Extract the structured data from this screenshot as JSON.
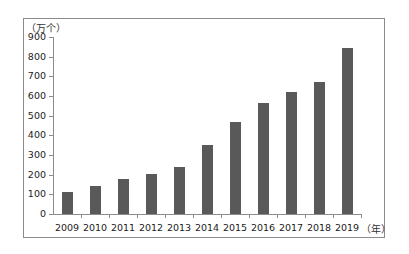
{
  "chart_data": {
    "type": "bar",
    "title": "",
    "xlabel": "（年）",
    "ylabel": "（万个）",
    "categories": [
      "2009",
      "2010",
      "2011",
      "2012",
      "2013",
      "2014",
      "2015",
      "2016",
      "2017",
      "2018",
      "2019"
    ],
    "values": [
      110,
      140,
      176,
      205,
      241,
      351,
      468,
      563,
      622,
      669,
      845
    ],
    "ylim": [
      0,
      900
    ],
    "yticks": [
      "0",
      "100",
      "200",
      "300",
      "400",
      "500",
      "600",
      "700",
      "800",
      "900"
    ],
    "grid": false,
    "legend": null,
    "bar_color": "#595959"
  }
}
